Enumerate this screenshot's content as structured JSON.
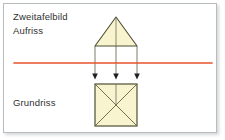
{
  "figure": {
    "title_label": "Zweitafelbild",
    "elevation_label": "Aufriss",
    "plan_label": "Grundriss",
    "colors": {
      "ground_line": "#E8522E",
      "shape_fill": "#F7F4CF",
      "shape_stroke": "#4F4F33",
      "projector_line": "#6E6E5A",
      "text": "#2F2F2F",
      "panel_border": "#B9BCBE",
      "background": "#FFFFFF"
    },
    "elevation_view": {
      "shape": "triangle",
      "apex": {
        "x": 116,
        "y": 17
      },
      "base_left": {
        "x": 95,
        "y": 46
      },
      "base_right": {
        "x": 137,
        "y": 46
      },
      "has_center_axis": true
    },
    "plan_view": {
      "shape": "square",
      "left": 95,
      "top": 84,
      "right": 137,
      "bottom": 126,
      "has_diagonals": true,
      "has_center_axis": true
    },
    "ground_line": {
      "y": 63,
      "x_start": 14,
      "x_end": 212,
      "thickness": 1.6
    },
    "projectors": [
      {
        "x": 95,
        "y_start": 46,
        "y_end": 78,
        "arrow": "down"
      },
      {
        "x": 116,
        "y_start": 17,
        "y_end": 78,
        "arrow": "down"
      },
      {
        "x": 137,
        "y_start": 46,
        "y_end": 78,
        "arrow": "down"
      }
    ]
  }
}
